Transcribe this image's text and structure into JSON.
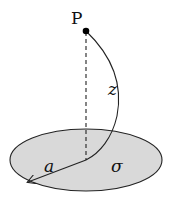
{
  "diagram": {
    "labels": {
      "point": "P",
      "distance": "z",
      "radius": "a",
      "surface_density": "σ"
    },
    "colors": {
      "disk_fill": "#d9d9d9",
      "stroke": "#222222",
      "point": "#000000"
    }
  }
}
